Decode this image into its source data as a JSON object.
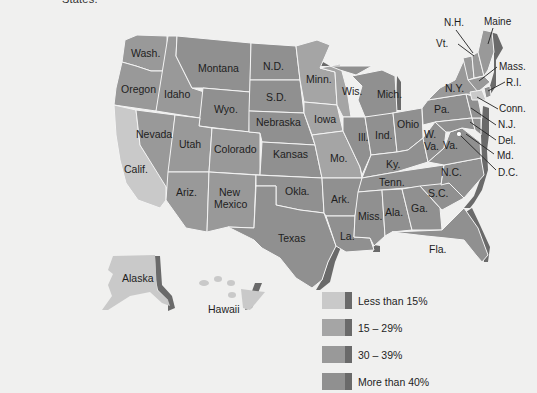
{
  "figure": {
    "caption_fragment": "States."
  },
  "colors": {
    "background": "#f0f0ef",
    "lt15": "#c9c9c9",
    "p15_29": "#a5a5a5",
    "p30_39": "#999999",
    "gt40": "#909090",
    "shadow": "#6a6a6a",
    "border": "#f4f4f4"
  },
  "legend": {
    "items": [
      {
        "label": "Less than 15%",
        "category": "lt15"
      },
      {
        "label": "15 – 29%",
        "category": "p15_29"
      },
      {
        "label": "30 – 39%",
        "category": "p30_39"
      },
      {
        "label": "More than 40%",
        "category": "gt40"
      }
    ]
  },
  "states": {
    "wash": "Wash.",
    "oregon": "Oregon",
    "calif": "Calif.",
    "idaho": "Idaho",
    "nevada": "Nevada",
    "montana": "Montana",
    "wyo": "Wyo.",
    "utah": "Utah",
    "colorado": "Colorado",
    "ariz": "Ariz.",
    "new_mexico_1": "New",
    "new_mexico_2": "Mexico",
    "nd": "N.D.",
    "sd": "S.D.",
    "nebraska": "Nebraska",
    "kansas": "Kansas",
    "okla": "Okla.",
    "texas": "Texas",
    "minn": "Minn.",
    "iowa": "Iowa",
    "mo": "Mo.",
    "ark": "Ark.",
    "la": "La.",
    "wis": "Wis.",
    "ill": "Ill.",
    "mich": "Mich.",
    "ind": "Ind.",
    "ohio": "Ohio",
    "ky": "Ky.",
    "tenn": "Tenn.",
    "miss": "Miss.",
    "ala": "Ala.",
    "ga": "Ga.",
    "fla": "Fla.",
    "sc": "S.C.",
    "nc": "N.C.",
    "va": "Va.",
    "wva_1": "W.",
    "wva_2": "Va.",
    "pa": "Pa.",
    "ny": "N.Y.",
    "vt": "Vt.",
    "nh": "N.H.",
    "maine": "Maine",
    "mass": "Mass.",
    "ri": "R.I.",
    "conn": "Conn.",
    "nj": "N.J.",
    "del": "Del.",
    "md": "Md.",
    "dc": "D.C.",
    "alaska": "Alaska",
    "hawaii": "Hawaii"
  },
  "categories": {
    "lt15": [
      "Calif.",
      "Alaska",
      "Hawaii",
      "Conn."
    ],
    "p15_29": [
      "Minn.",
      "Iowa",
      "Mo.",
      "Wis."
    ],
    "p30_39": [
      "Wash.",
      "Oregon",
      "Idaho",
      "Nevada",
      "Utah",
      "Ariz.",
      "Colorado",
      "New Mexico",
      "Mass.",
      "Vt.",
      "N.H.",
      "Maine",
      "N.Y."
    ],
    "gt40": [
      "Montana",
      "Wyo.",
      "N.D.",
      "S.D.",
      "Nebraska",
      "Kansas",
      "Okla.",
      "Texas",
      "Ark.",
      "La.",
      "Ill.",
      "Ind.",
      "Ohio",
      "Mich.",
      "Ky.",
      "Tenn.",
      "Miss.",
      "Ala.",
      "Ga.",
      "Fla.",
      "S.C.",
      "N.C.",
      "Va.",
      "W. Va.",
      "Pa.",
      "N.J.",
      "Del.",
      "Md.",
      "R.I."
    ]
  }
}
